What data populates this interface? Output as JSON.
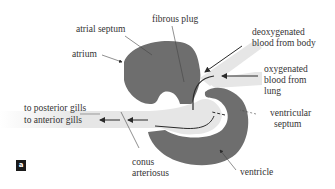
{
  "figure": {
    "panel_label": "a",
    "colors": {
      "tissue": "#6e6e6e",
      "vessel": "#e6e6e6",
      "arrow": "#2a2a2a",
      "text": "#333333",
      "badge_bg": "#1a1a1a"
    }
  },
  "labels": {
    "atrial_septum": "atrial septum",
    "atrium": "atrium",
    "fibrous_plug": "fibrous plug",
    "deoxygenated_line1": "deoxygenated",
    "deoxygenated_line2": "blood from body",
    "oxygenated_line1": "oxygenated",
    "oxygenated_line2": "blood from",
    "oxygenated_line3": "lung",
    "to_posterior_gills": "to posterior gills",
    "to_anterior_gills": "to anterior gills",
    "ventricular_septum_line1": "ventricular",
    "ventricular_septum_line2": "septum",
    "conus_line1": "conus",
    "conus_line2": "arteriosus",
    "ventricle": "ventricle"
  }
}
